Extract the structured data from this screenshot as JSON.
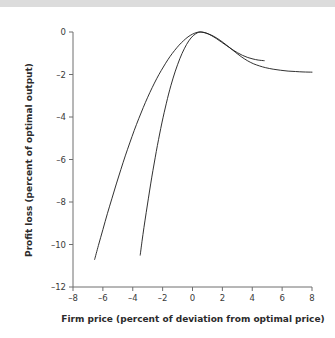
{
  "chart_data": {
    "type": "line",
    "title": "",
    "subtitle": "",
    "xlabel": "Firm price (percent of deviation from optimal price)",
    "ylabel": "Profit loss (percent of optimal output)",
    "xlim": [
      -8,
      8
    ],
    "ylim": [
      -12,
      0
    ],
    "xticks": [
      -8,
      -6,
      -4,
      -2,
      0,
      2,
      4,
      6,
      8
    ],
    "yticks": [
      0,
      -2,
      -4,
      -6,
      -8,
      -10,
      -12
    ],
    "xtick_labels": [
      "–8",
      "–6",
      "–4",
      "–2",
      "0",
      "2",
      "4",
      "6",
      "8"
    ],
    "ytick_labels": [
      "0",
      "–2",
      "–4",
      "–6",
      "–8",
      "–10",
      "–12"
    ],
    "grid": false,
    "legend": "none",
    "annotations": [],
    "series": [
      {
        "name": "flat-profit-curve",
        "color": "#1a1a1a",
        "points": [
          [
            -6.55,
            -10.7
          ],
          [
            -6.3,
            -10.05
          ],
          [
            -6.0,
            -9.3
          ],
          [
            -5.7,
            -8.55
          ],
          [
            -5.4,
            -7.85
          ],
          [
            -5.1,
            -7.15
          ],
          [
            -4.8,
            -6.48
          ],
          [
            -4.5,
            -5.83
          ],
          [
            -4.2,
            -5.22
          ],
          [
            -3.9,
            -4.63
          ],
          [
            -3.6,
            -4.08
          ],
          [
            -3.3,
            -3.56
          ],
          [
            -3.0,
            -3.07
          ],
          [
            -2.7,
            -2.62
          ],
          [
            -2.4,
            -2.2
          ],
          [
            -2.1,
            -1.82
          ],
          [
            -1.8,
            -1.47
          ],
          [
            -1.5,
            -1.15
          ],
          [
            -1.2,
            -0.87
          ],
          [
            -0.9,
            -0.62
          ],
          [
            -0.6,
            -0.41
          ],
          [
            -0.3,
            -0.23
          ],
          [
            0.0,
            -0.1
          ],
          [
            0.3,
            -0.02
          ],
          [
            0.55,
            0.0
          ],
          [
            0.9,
            -0.05
          ],
          [
            1.3,
            -0.16
          ],
          [
            1.7,
            -0.32
          ],
          [
            2.1,
            -0.52
          ],
          [
            2.5,
            -0.74
          ],
          [
            2.9,
            -0.97
          ],
          [
            3.3,
            -1.18
          ],
          [
            3.7,
            -1.36
          ],
          [
            4.1,
            -1.5
          ],
          [
            4.5,
            -1.6
          ],
          [
            4.9,
            -1.68
          ],
          [
            5.4,
            -1.75
          ],
          [
            5.9,
            -1.8
          ],
          [
            6.4,
            -1.84
          ],
          [
            6.9,
            -1.86
          ],
          [
            7.4,
            -1.88
          ],
          [
            8.0,
            -1.89
          ]
        ]
      },
      {
        "name": "steep-profit-curve",
        "color": "#1a1a1a",
        "points": [
          [
            -3.5,
            -10.5
          ],
          [
            -3.38,
            -9.85
          ],
          [
            -3.25,
            -9.2
          ],
          [
            -3.1,
            -8.5
          ],
          [
            -2.95,
            -7.82
          ],
          [
            -2.8,
            -7.15
          ],
          [
            -2.65,
            -6.52
          ],
          [
            -2.5,
            -5.92
          ],
          [
            -2.35,
            -5.34
          ],
          [
            -2.2,
            -4.8
          ],
          [
            -2.05,
            -4.28
          ],
          [
            -1.9,
            -3.8
          ],
          [
            -1.75,
            -3.35
          ],
          [
            -1.6,
            -2.92
          ],
          [
            -1.45,
            -2.53
          ],
          [
            -1.3,
            -2.17
          ],
          [
            -1.15,
            -1.84
          ],
          [
            -1.0,
            -1.54
          ],
          [
            -0.85,
            -1.26
          ],
          [
            -0.7,
            -1.01
          ],
          [
            -0.55,
            -0.79
          ],
          [
            -0.4,
            -0.59
          ],
          [
            -0.25,
            -0.42
          ],
          [
            -0.1,
            -0.28
          ],
          [
            0.05,
            -0.17
          ],
          [
            0.2,
            -0.09
          ],
          [
            0.35,
            -0.03
          ],
          [
            0.5,
            0.0
          ],
          [
            0.7,
            -0.01
          ],
          [
            0.95,
            -0.06
          ],
          [
            1.25,
            -0.16
          ],
          [
            1.6,
            -0.31
          ],
          [
            1.95,
            -0.48
          ],
          [
            2.3,
            -0.65
          ],
          [
            2.65,
            -0.82
          ],
          [
            3.0,
            -0.97
          ],
          [
            3.35,
            -1.1
          ],
          [
            3.7,
            -1.2
          ],
          [
            4.05,
            -1.27
          ],
          [
            4.4,
            -1.32
          ],
          [
            4.8,
            -1.35
          ]
        ]
      }
    ]
  }
}
